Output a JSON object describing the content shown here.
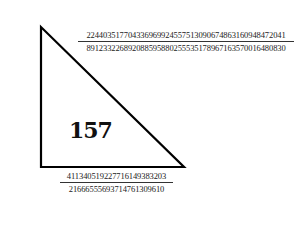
{
  "diagram": {
    "type": "right-triangle",
    "area_label": "157",
    "hypotenuse": {
      "numerator": "224403517704336969924557513090674863160948472041",
      "denominator": "891233226892088595880255535178967163570016480830"
    },
    "vertical_leg": {
      "numerator": "6803298487826435051217540",
      "denominator": "411340519227716149383203"
    },
    "horizontal_leg": {
      "numerator": "411340519227716149383203",
      "denominator": "21666555693714761309610"
    },
    "colors": {
      "stroke": "#000000",
      "text": "#222222",
      "background": "#ffffff"
    }
  }
}
